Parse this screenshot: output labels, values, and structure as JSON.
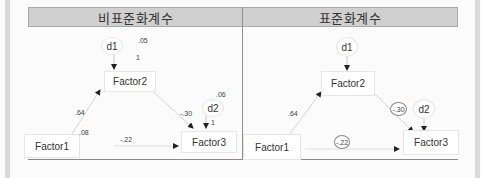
{
  "panels": {
    "unstandardized": {
      "title": "비표준화계수",
      "nodes": {
        "d1": "d1",
        "d2": "d2",
        "factor1": "Factor1",
        "factor2": "Factor2",
        "factor3": "Factor3"
      },
      "coefficients": {
        "d1_variance": ".05",
        "d1_to_factor2": "1",
        "factor1_to_factor2": ".64",
        "factor1_variance": ".08",
        "factor2_to_factor3": "-.30",
        "d2_variance": ".06",
        "d2_to_factor3": "1",
        "factor1_to_factor3": "-.22"
      }
    },
    "standardized": {
      "title": "표준화계수",
      "nodes": {
        "d1": "d1",
        "d2": "d2",
        "factor1": "Factor1",
        "factor2": "Factor2",
        "factor3": "Factor3"
      },
      "coefficients": {
        "factor1_to_factor2": ".64",
        "factor2_to_factor3": "-.30",
        "factor1_to_factor3": "-.22"
      }
    }
  },
  "colors": {
    "header_bg": "#d0d0d0",
    "arrow": "#c8c8c8",
    "arrow_head": "#222222",
    "text": "#333333"
  }
}
